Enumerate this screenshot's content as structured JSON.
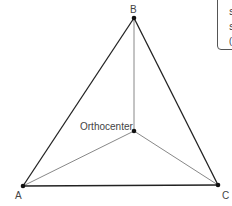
{
  "diagram": {
    "vertices": [
      {
        "name": "A",
        "label": "A",
        "x": 23,
        "y": 186
      },
      {
        "name": "B",
        "label": "B",
        "x": 134,
        "y": 18
      },
      {
        "name": "C",
        "label": "C",
        "x": 218,
        "y": 185
      }
    ],
    "orthocenter": {
      "label": "Orthocenter",
      "x": 134,
      "y": 131
    },
    "colors": {
      "triangle_edge": "#222222",
      "altitude": "#888888",
      "point": "#111111",
      "label": "#444444"
    }
  },
  "info_box": {
    "lines": [
      "S",
      "S",
      "("
    ]
  }
}
